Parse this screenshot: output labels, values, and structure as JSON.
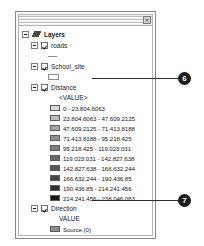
{
  "window": {
    "close_label": "×",
    "close_icon": "close-icon"
  },
  "tree": {
    "root": {
      "label": "Layers",
      "icon": "layers-stack-icon"
    },
    "layers": [
      {
        "name": "roads",
        "symbol_type": "line",
        "checked": true
      },
      {
        "name": "School_site",
        "symbol_type": "polygon-outline",
        "checked": true
      },
      {
        "name": "Distance",
        "checked": true,
        "value_header": "<VALUE>",
        "classes": [
          {
            "label": "0 - 23.804.6063",
            "color": "#d9d9d9"
          },
          {
            "label": "23.804.6063 - 47.609.2125",
            "color": "#bdbdbd"
          },
          {
            "label": "47.609.2125 - 71.413.8188",
            "color": "#a6a6a6"
          },
          {
            "label": "71.413.8188 - 95.218.425",
            "color": "#919191"
          },
          {
            "label": "95.218.425 - 119.023.031",
            "color": "#7d7d7d"
          },
          {
            "label": "119.023.031 - 142.827.638",
            "color": "#6b6b6b"
          },
          {
            "label": "142.827.638 - 166.632.244",
            "color": "#585858"
          },
          {
            "label": "166.632.244 - 190.436.85",
            "color": "#444444"
          },
          {
            "label": "190.436.85 - 214.241.456",
            "color": "#2e2e2e"
          },
          {
            "label": "214.241.456 - 238.046.063",
            "color": "#171717"
          }
        ]
      },
      {
        "name": "Direction",
        "checked": true,
        "value_header": "VALUE",
        "classes": [
          {
            "label": "Source (0)",
            "color": "#8d8d8d"
          },
          {
            "label": "Right (1)",
            "color": "#e4e4e4"
          },
          {
            "label": "Lower-Right (2)",
            "color": "#b5b5b5"
          }
        ]
      }
    ]
  },
  "callouts": [
    {
      "number": "6",
      "target": "Distance"
    },
    {
      "number": "7",
      "target": "Direction"
    }
  ]
}
